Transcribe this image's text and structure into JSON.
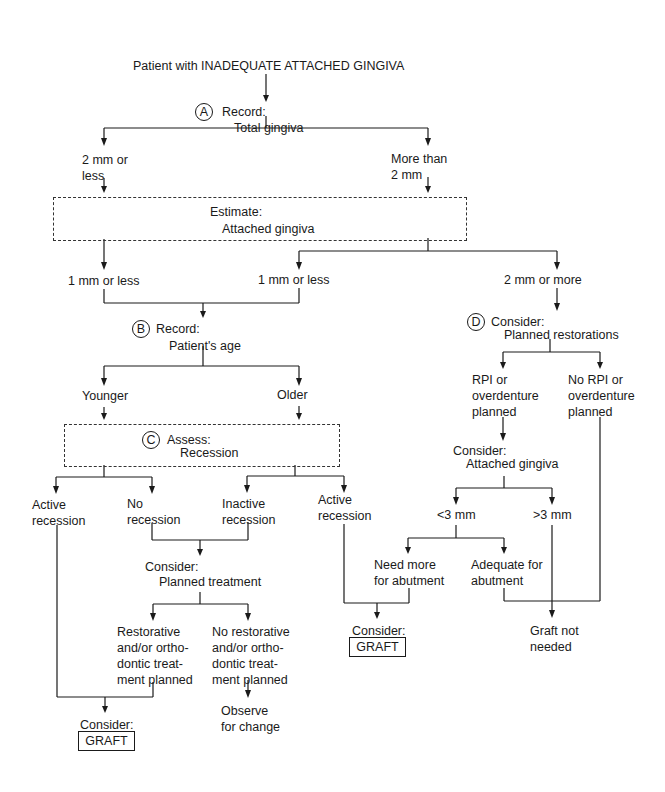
{
  "title": "Patient with INADEQUATE ATTACHED GINGIVA",
  "nodes": {
    "A": {
      "marker": "A",
      "action": "Record:",
      "subject": "Total gingiva"
    },
    "a_left": "2 mm or\nless",
    "a_right": "More than\n2 mm",
    "estimate": {
      "action": "Estimate:",
      "subject": "Attached gingiva"
    },
    "e1": "1 mm or less",
    "e2": "1 mm or less",
    "e3": "2 mm or more",
    "B": {
      "marker": "B",
      "action": "Record:",
      "subject": "Patient's age"
    },
    "younger": "Younger",
    "older": "Older",
    "C": {
      "marker": "C",
      "action": "Assess:",
      "subject": "Recession"
    },
    "c1": "Active\nrecession",
    "c2": "No\nrecession",
    "c3": "Inactive\nrecession",
    "c4": "Active\nrecession",
    "planned_treatment": {
      "action": "Consider:",
      "subject": "Planned treatment"
    },
    "restorative": "Restorative\nand/or ortho-\ndontic treat-\nment planned",
    "no_restorative": "No restorative\nand/or ortho-\ndontic treat-\nment planned",
    "observe": "Observe\nfor change",
    "graft_left": {
      "label": "Consider:",
      "box": "GRAFT"
    },
    "D": {
      "marker": "D",
      "action": "Consider:",
      "subject": "Planned restorations"
    },
    "rpi": "RPI or\noverdenture\nplanned",
    "no_rpi": "No RPI or\noverdenture\nplanned",
    "attached": {
      "action": "Consider:",
      "subject": "Attached gingiva"
    },
    "lt3": "<3 mm",
    "gt3": ">3 mm",
    "need_more": "Need more\nfor abutment",
    "adequate": "Adequate for\nabutment",
    "graft_mid": {
      "label": "Consider:",
      "box": "GRAFT"
    },
    "not_needed": "Graft not\nneeded"
  }
}
